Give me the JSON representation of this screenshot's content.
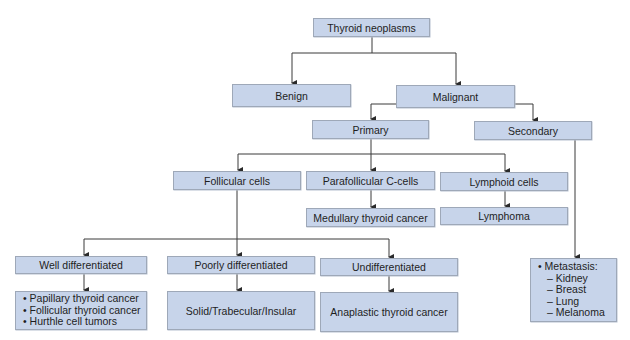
{
  "diagram": {
    "title": "Thyroid neoplasms",
    "level1": {
      "benign": "Benign",
      "malignant": "Malignant"
    },
    "level2": {
      "primary": "Primary",
      "secondary": "Secondary"
    },
    "level3": {
      "follicular": "Follicular cells",
      "parafollicular": "Parafollicular C-cells",
      "lymphoid": "Lymphoid cells"
    },
    "level3_outcomes": {
      "medullary": "Medullary thyroid cancer",
      "lymphoma": "Lymphoma"
    },
    "level4": {
      "well": "Well differentiated",
      "poorly": "Poorly differentiated",
      "undiff": "Undifferentiated"
    },
    "level4_outcomes": {
      "well_items": [
        "• Papillary thyroid cancer",
        "• Follicular thyroid cancer",
        "• Hurthle cell tumors"
      ],
      "poorly": "Solid/Trabecular/Insular",
      "undiff": "Anaplastic thyroid cancer"
    },
    "secondary_outcome": {
      "heading": "• Metastasis:",
      "items": [
        "– Kidney",
        "– Breast",
        "– Lung",
        "– Melanoma"
      ]
    }
  },
  "colors": {
    "box_fill": "#c7d4ea",
    "box_border": "#9ea8b8",
    "line": "#3a3a3a"
  }
}
